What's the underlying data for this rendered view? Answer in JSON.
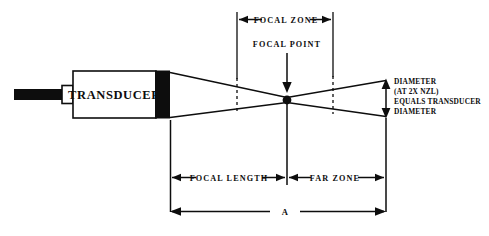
{
  "diagram": {
    "probe": {
      "label": "TRANSDUCER",
      "cable_name": "cable",
      "connector_name": "connector-collar",
      "face_name": "transducer-face"
    },
    "labels": {
      "focal_zone": "FOCAL ZONE",
      "focal_point": "FOCAL POINT",
      "focal_length": "FOCAL  LENGTH",
      "far_zone": "FAR ZONE",
      "overall": "A"
    },
    "diameter_note": [
      "DIAMETER",
      "(AT 2X NZL)",
      "EQUALS TRANSDUCER",
      "DIAMETER"
    ],
    "colors": {
      "ink": "#0d0d0d",
      "paper": "#ffffff"
    }
  }
}
